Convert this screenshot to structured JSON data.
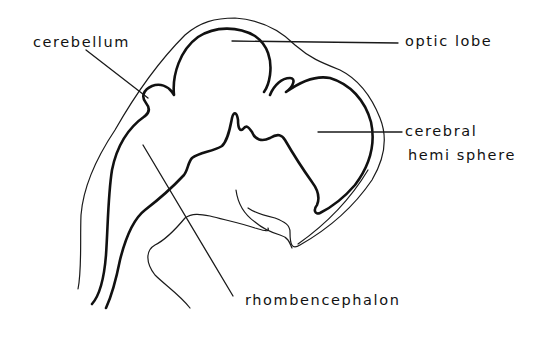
{
  "diagram": {
    "type": "labeled anatomical line drawing",
    "labels": [
      {
        "id": "cerebellum",
        "text": "cerebellum"
      },
      {
        "id": "optic-lobe",
        "text": "optic lobe"
      },
      {
        "id": "cerebral-hemisphere-line1",
        "text": "cerebral"
      },
      {
        "id": "cerebral-hemisphere-line2",
        "text": "hemi sphere"
      },
      {
        "id": "rhombencephalon",
        "text": "rhombencephalon"
      }
    ],
    "colors": {
      "background": "#ffffff",
      "ink": "#111111"
    }
  }
}
